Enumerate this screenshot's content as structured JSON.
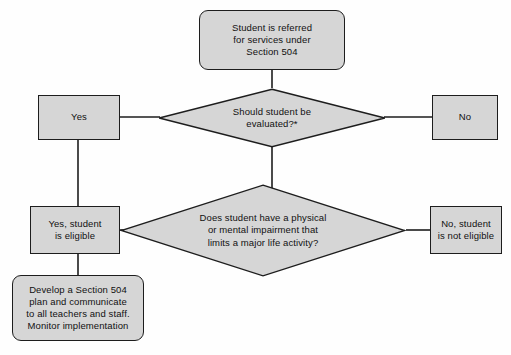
{
  "diagram": {
    "background_color": "#fefefe",
    "shape_fill": "#d6d6d6",
    "shape_stroke": "#1d1d1d",
    "text_color": "#111111",
    "nodes": [
      {
        "id": "referral",
        "shape": "rounded-rectangle",
        "text": "Student is referred\nfor services under\nSection 504"
      },
      {
        "id": "should-evaluate",
        "shape": "diamond",
        "text": "Should student be\nevaluated?*"
      },
      {
        "id": "yes-evaluate",
        "shape": "rectangle",
        "text": "Yes"
      },
      {
        "id": "no-evaluate",
        "shape": "rectangle",
        "text": "No"
      },
      {
        "id": "impairment-question",
        "shape": "diamond",
        "text": "Does student have a physical\nor mental impairment that\nlimits a major life activity?"
      },
      {
        "id": "yes-eligible",
        "shape": "rectangle",
        "text": "Yes, student\nis eligible"
      },
      {
        "id": "no-eligible",
        "shape": "rectangle",
        "text": "No, student\nis not eligible"
      },
      {
        "id": "develop-plan",
        "shape": "rounded-rectangle",
        "text": "Develop a Section 504\nplan and communicate\nto all teachers and staff.\nMonitor implementation"
      }
    ],
    "edges": [
      {
        "from": "referral",
        "to": "should-evaluate",
        "label": ""
      },
      {
        "from": "should-evaluate",
        "to": "yes-evaluate",
        "label": ""
      },
      {
        "from": "should-evaluate",
        "to": "no-evaluate",
        "label": ""
      },
      {
        "from": "should-evaluate",
        "to": "impairment-question",
        "label": ""
      },
      {
        "from": "yes-evaluate",
        "to": "yes-eligible",
        "label": ""
      },
      {
        "from": "impairment-question",
        "to": "yes-eligible",
        "label": ""
      },
      {
        "from": "impairment-question",
        "to": "no-eligible",
        "label": ""
      },
      {
        "from": "yes-eligible",
        "to": "develop-plan",
        "label": ""
      }
    ]
  }
}
